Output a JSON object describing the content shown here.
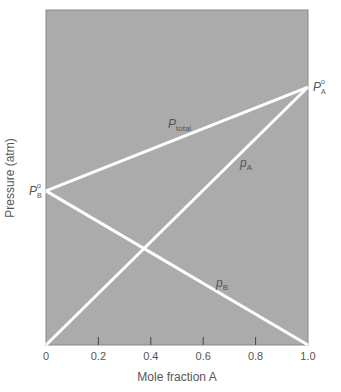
{
  "chart_data": {
    "type": "line",
    "title": "",
    "xlabel": "Mole fraction A",
    "ylabel": "Pressure (atm)",
    "xlim": [
      0,
      1.0
    ],
    "ylim": [
      0,
      1.0
    ],
    "x_ticks": [
      "0",
      "0.2",
      "0.4",
      "0.6",
      "0.8",
      "1.0"
    ],
    "x_tick_values": [
      0,
      0.2,
      0.4,
      0.6,
      0.8,
      1.0
    ],
    "y_ticks": [],
    "grid": false,
    "background": "#ababab",
    "line_color": "#ffffff",
    "series": [
      {
        "name": "P_total",
        "label_main": "P",
        "label_sub": "total",
        "x": [
          0,
          1.0
        ],
        "y": [
          0.46,
          0.77
        ]
      },
      {
        "name": "p_A",
        "label_main": "p",
        "label_sub": "A",
        "x": [
          0,
          1.0
        ],
        "y": [
          0,
          0.77
        ]
      },
      {
        "name": "p_B",
        "label_main": "p",
        "label_sub": "B",
        "x": [
          0,
          1.0
        ],
        "y": [
          0.46,
          0
        ]
      }
    ],
    "annotations": [
      {
        "text": "P°A",
        "main": "P",
        "sup": "o",
        "sub": "A",
        "x": 1.0,
        "y": 0.77,
        "position": "right"
      },
      {
        "text": "P°B",
        "main": "P",
        "sup": "o",
        "sub": "B",
        "x": 0,
        "y": 0.46,
        "position": "left"
      }
    ]
  }
}
